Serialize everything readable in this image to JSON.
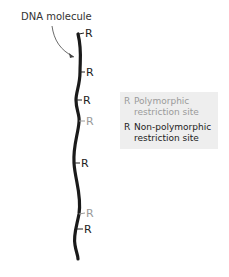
{
  "title_label": "DNA molecule",
  "colors": {
    "non_polymorphic": "#222222",
    "polymorphic": "#9a9a9a",
    "strand": "#1a1a1a",
    "legend_bg": "#eeeeee"
  },
  "sites": [
    {
      "symbol": "R",
      "type": "non-polymorphic",
      "y": 33
    },
    {
      "symbol": "R",
      "type": "non-polymorphic",
      "y": 72
    },
    {
      "symbol": "R",
      "type": "non-polymorphic",
      "y": 100
    },
    {
      "symbol": "R",
      "type": "polymorphic",
      "y": 121
    },
    {
      "symbol": "R",
      "type": "non-polymorphic",
      "y": 163
    },
    {
      "symbol": "R",
      "type": "polymorphic",
      "y": 214
    },
    {
      "symbol": "R",
      "type": "non-polymorphic",
      "y": 229
    }
  ],
  "legend": {
    "items": [
      {
        "symbol": "R",
        "line1": "Polymorphic",
        "line2": "restriction site",
        "type": "polymorphic"
      },
      {
        "symbol": "R",
        "line1": "Non-polymorphic",
        "line2": "restriction site",
        "type": "non-polymorphic"
      }
    ]
  }
}
